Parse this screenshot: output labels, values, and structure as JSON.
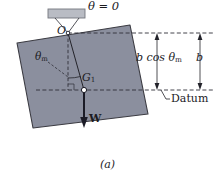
{
  "figure": {
    "caption": "(a)",
    "kind": "physics-free-body-diagram"
  },
  "colors": {
    "plate_fill": "#8b8f9e",
    "plate_stroke": "#3b3b42",
    "support_fill": "#b9bcc4",
    "support_stroke": "#6f7278",
    "line": "#2a2a31",
    "dashed": "#3a3a44",
    "text": "#1b1b1f",
    "background": "#ffffff"
  },
  "labels": {
    "theta_zero": "θ = 0",
    "pivot": "O",
    "theta_m": "θ",
    "theta_m_sub": "m",
    "center_of_gravity": "G",
    "center_of_gravity_sub": "1",
    "weight": "W",
    "height_drop": "b cos θ",
    "height_drop_sub": "m",
    "arm_length": "b",
    "datum": "Datum",
    "caption": "(a)"
  },
  "geometry": {
    "pivot_point": {
      "x": 68,
      "y": 33
    },
    "center_of_gravity_point": {
      "x": 84,
      "y": 90
    },
    "weight_arrow_tip": {
      "x": 84,
      "y": 127
    },
    "plate_corners": [
      {
        "x": 17,
        "y": 43
      },
      {
        "x": 130,
        "y": 25
      },
      {
        "x": 148,
        "y": 114
      },
      {
        "x": 33,
        "y": 128
      }
    ],
    "support_bar": {
      "x": 48,
      "y": 9,
      "width": 37,
      "height": 9
    },
    "datum_line_y": 90,
    "top_reference_line_y": 33,
    "dimension_x_bcos": 157,
    "dimension_x_b": 200
  },
  "annotations": {
    "description": "Square plate suspended from pivot O at its upper corner; the line from O to center of gravity G1 makes angle theta_m with the vertical. The weight W acts downward at G1. Vertical drop of G1 below pivot level is b cos theta_m, where b is the distance from O to G1.",
    "dimension_entries": [
      {
        "label": "b cos θm",
        "from_y": 33,
        "to_y": 90
      },
      {
        "label": "b",
        "from_y": 33,
        "to_y": 90
      }
    ]
  }
}
